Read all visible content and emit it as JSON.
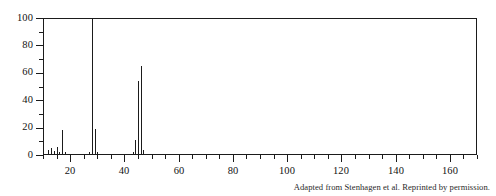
{
  "figure": {
    "caption": "Adapted from Stenhagen et al. Reprinted by permission.",
    "ink_color": "#1b1b1b",
    "background_color": "#ffffff"
  },
  "chart_data": {
    "type": "bar",
    "title": "",
    "xlabel": "",
    "ylabel": "",
    "xlim": [
      10,
      170
    ],
    "ylim": [
      0,
      100
    ],
    "grid": false,
    "legend": null,
    "x_major_ticks": [
      20,
      40,
      60,
      80,
      100,
      120,
      140,
      160
    ],
    "x_minor_tick_interval": 5,
    "y_major_ticks": [
      0,
      20,
      40,
      60,
      80,
      100
    ],
    "y_minor_tick_interval": 10,
    "x_tick_labels": [
      "20",
      "40",
      "60",
      "80",
      "100",
      "120",
      "140",
      "160"
    ],
    "y_tick_labels": [
      "0",
      "20",
      "40",
      "60",
      "80",
      "100"
    ],
    "x": [
      12,
      13,
      14,
      15,
      16,
      17,
      18,
      26,
      27,
      28,
      29,
      30,
      43,
      44,
      45,
      46,
      47,
      48
    ],
    "values": [
      4,
      5,
      3,
      6,
      2,
      18,
      2,
      1,
      2,
      100,
      19,
      2,
      2,
      11,
      54,
      65,
      4,
      1
    ],
    "base_peak_mz": 28,
    "base_peak_intensity": 100
  }
}
